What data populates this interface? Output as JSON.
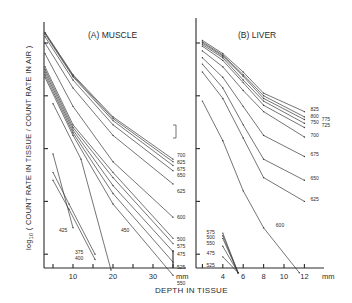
{
  "chart_data": [
    {
      "type": "line",
      "panel": "A",
      "title": "(A) MUSCLE",
      "xlabel": "DEPTH IN TISSUE",
      "xunit": "mm",
      "ylabel": "log10 ( COUNT RATE IN TISSUE / COUNT RATE IN AIR )",
      "xlim": [
        2.8,
        38
      ],
      "ylim": [
        -4.3,
        0.4
      ],
      "xticks": [
        10,
        20,
        30
      ],
      "xticks_minor": [
        5,
        10,
        15,
        20,
        25,
        30,
        35
      ],
      "yticks": [
        0,
        -1,
        -2,
        -3,
        -4
      ],
      "grid": false,
      "series": [
        {
          "name": "700",
          "x": [
            3,
            10,
            20,
            35
          ],
          "y": [
            0.2,
            -0.6,
            -1.4,
            -2.2
          ]
        },
        {
          "name": "825",
          "x": [
            3,
            10,
            20,
            35
          ],
          "y": [
            0.19,
            -0.62,
            -1.43,
            -2.25
          ]
        },
        {
          "name": "675",
          "x": [
            3,
            10,
            20,
            35
          ],
          "y": [
            0.17,
            -0.64,
            -1.47,
            -2.32
          ]
        },
        {
          "name": "650",
          "x": [
            3,
            10,
            20,
            35
          ],
          "y": [
            0.12,
            -0.7,
            -1.55,
            -2.42
          ]
        },
        {
          "name": "625",
          "x": [
            3,
            10,
            20,
            35
          ],
          "y": [
            0.0,
            -0.85,
            -1.75,
            -2.67
          ]
        },
        {
          "name": "600",
          "x": [
            3,
            10,
            20,
            35
          ],
          "y": [
            -0.2,
            -1.2,
            -2.25,
            -3.3
          ]
        },
        {
          "name": "500",
          "x": [
            3,
            10,
            20,
            35
          ],
          "y": [
            -0.45,
            -1.55,
            -2.45,
            -3.7
          ]
        },
        {
          "name": "575",
          "x": [
            3,
            10,
            20,
            35
          ],
          "y": [
            -0.5,
            -1.6,
            -2.55,
            -3.8
          ]
        },
        {
          "name": "475",
          "x": [
            3,
            10,
            20,
            35
          ],
          "y": [
            -0.55,
            -1.65,
            -2.7,
            -3.95
          ]
        },
        {
          "name": "525",
          "x": [
            3,
            10,
            20,
            35
          ],
          "y": [
            -0.6,
            -1.7,
            -2.85,
            -4.15
          ]
        },
        {
          "name": "550",
          "x": [
            3,
            10,
            20,
            35
          ],
          "y": [
            -0.65,
            -1.75,
            -3.05,
            -4.4
          ]
        },
        {
          "name": "450",
          "x": [
            5,
            12,
            19.5
          ],
          "y": [
            -1.15,
            -2.2,
            -4.3
          ]
        },
        {
          "name": "425",
          "x": [
            5,
            10
          ],
          "y": [
            -2.1,
            -3.5
          ]
        },
        {
          "name": "375",
          "x": [
            5,
            9,
            15.5
          ],
          "y": [
            -2.45,
            -3.05,
            -4.0
          ]
        },
        {
          "name": "400",
          "x": [
            5,
            9,
            15.5
          ],
          "y": [
            -2.6,
            -3.15,
            -4.1
          ]
        }
      ],
      "series_labels": [
        {
          "text": "700",
          "x": 36,
          "y": -2.12
        },
        {
          "text": "825",
          "x": 36,
          "y": -2.25
        },
        {
          "text": "675",
          "x": 36,
          "y": -2.38
        },
        {
          "text": "650",
          "x": 36,
          "y": -2.5
        },
        {
          "text": "625",
          "x": 36,
          "y": -2.8
        },
        {
          "text": "600",
          "x": 36,
          "y": -3.3
        },
        {
          "text": "500",
          "x": 36,
          "y": -3.72
        },
        {
          "text": "575",
          "x": 36,
          "y": -3.84
        },
        {
          "text": "475",
          "x": 36,
          "y": -4.0
        },
        {
          "text": "525",
          "x": 36,
          "y": -4.25
        },
        {
          "text": "550",
          "x": 36,
          "y": -4.55
        },
        {
          "text": "450",
          "x": 22,
          "y": -3.55
        },
        {
          "text": "425",
          "x": 6.5,
          "y": -3.55
        },
        {
          "text": "375",
          "x": 10.5,
          "y": -3.95
        },
        {
          "text": "400",
          "x": 10.5,
          "y": -4.08
        }
      ]
    },
    {
      "type": "line",
      "panel": "B",
      "title": "(B) LIVER",
      "xlabel": "DEPTH IN TISSUE",
      "xunit": "mm",
      "ylabel": "log10 ( COUNT RATE IN TISSUE / COUNT RATE IN AIR )",
      "xlim": [
        1.4,
        14.0
      ],
      "ylim": [
        -4.3,
        0.4
      ],
      "xticks": [
        4,
        6,
        8,
        10,
        12
      ],
      "yticks": [
        0,
        -1,
        -2,
        -3,
        -4
      ],
      "grid": false,
      "series": [
        {
          "name": "825",
          "x": [
            2,
            4,
            6,
            8,
            12
          ],
          "y": [
            0.05,
            -0.2,
            -0.55,
            -0.95,
            -1.3
          ]
        },
        {
          "name": "800",
          "x": [
            2,
            4,
            6,
            8,
            12
          ],
          "y": [
            0.02,
            -0.23,
            -0.6,
            -1.0,
            -1.4
          ]
        },
        {
          "name": "775",
          "x": [
            2,
            4,
            6,
            8,
            12
          ],
          "y": [
            0.0,
            -0.25,
            -0.63,
            -1.05,
            -1.45
          ]
        },
        {
          "name": "750",
          "x": [
            2,
            4,
            6,
            8,
            12
          ],
          "y": [
            -0.03,
            -0.28,
            -0.7,
            -1.1,
            -1.52
          ]
        },
        {
          "name": "725",
          "x": [
            2,
            4,
            6,
            8,
            12
          ],
          "y": [
            -0.06,
            -0.33,
            -0.75,
            -1.18,
            -1.6
          ]
        },
        {
          "name": "700",
          "x": [
            2,
            4,
            6,
            8,
            12
          ],
          "y": [
            -0.15,
            -0.45,
            -0.9,
            -1.3,
            -1.78
          ]
        },
        {
          "name": "675",
          "x": [
            2,
            4,
            6,
            8,
            12
          ],
          "y": [
            -0.28,
            -0.65,
            -1.2,
            -1.75,
            -2.15
          ]
        },
        {
          "name": "650",
          "x": [
            2,
            4,
            6,
            8,
            12
          ],
          "y": [
            -0.4,
            -0.85,
            -1.55,
            -2.2,
            -2.6
          ]
        },
        {
          "name": "625",
          "x": [
            2,
            4,
            6,
            8,
            12
          ],
          "y": [
            -0.55,
            -1.05,
            -1.8,
            -2.55,
            -3.0
          ]
        },
        {
          "name": "600",
          "x": [
            2,
            4,
            6,
            8,
            11.5
          ],
          "y": [
            -1.1,
            -1.85,
            -2.8,
            -3.5,
            -4.35
          ]
        },
        {
          "name": "575",
          "x": [
            4,
            5.5
          ],
          "y": [
            -3.6,
            -4.35
          ]
        },
        {
          "name": "500",
          "x": [
            4,
            5.5
          ],
          "y": [
            -3.65,
            -4.35
          ]
        },
        {
          "name": "550",
          "x": [
            4,
            5.5
          ],
          "y": [
            -3.7,
            -4.35
          ]
        },
        {
          "name": "475",
          "x": [
            4,
            5.5
          ],
          "y": [
            -3.85,
            -4.35
          ]
        },
        {
          "name": "525",
          "x": [
            4,
            5.5
          ],
          "y": [
            -4.05,
            -4.35
          ]
        }
      ],
      "series_labels": [
        {
          "text": "825",
          "x": 12.6,
          "y": -1.25
        },
        {
          "text": "800",
          "x": 12.6,
          "y": -1.38
        },
        {
          "text": "775",
          "x": 13.7,
          "y": -1.43
        },
        {
          "text": "750",
          "x": 12.6,
          "y": -1.5
        },
        {
          "text": "725",
          "x": 13.7,
          "y": -1.56
        },
        {
          "text": "700",
          "x": 12.6,
          "y": -1.75
        },
        {
          "text": "675",
          "x": 12.6,
          "y": -2.1
        },
        {
          "text": "650",
          "x": 12.6,
          "y": -2.55
        },
        {
          "text": "625",
          "x": 12.6,
          "y": -2.95
        },
        {
          "text": "600",
          "x": 9.2,
          "y": -3.45
        },
        {
          "text": "575",
          "x": 2.4,
          "y": -3.58
        },
        {
          "text": "500",
          "x": 2.4,
          "y": -3.68
        },
        {
          "text": "550",
          "x": 2.4,
          "y": -3.78
        },
        {
          "text": "475",
          "x": 2.4,
          "y": -3.97
        },
        {
          "text": "525",
          "x": 2.4,
          "y": -4.2
        }
      ]
    }
  ]
}
